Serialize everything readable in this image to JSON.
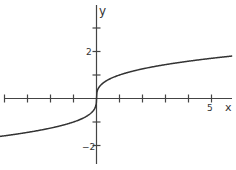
{
  "chart_data": {
    "type": "line",
    "title": "",
    "function": "y = cbrt(x)",
    "xlabel": "x",
    "ylabel": "y",
    "xlim": [
      -4.2,
      5.9
    ],
    "ylim": [
      -2.8,
      4
    ],
    "x_tick_labels": [
      {
        "value": 5,
        "label": "5"
      }
    ],
    "y_tick_labels": [
      {
        "value": 2,
        "label": "2"
      },
      {
        "value": -2,
        "label": "−2"
      }
    ],
    "x_ticks": [
      -4,
      -3,
      -2,
      -1,
      1,
      2,
      3,
      4,
      5
    ],
    "y_ticks": [
      3,
      2,
      1,
      -1,
      -2
    ],
    "grid": false,
    "series": [
      {
        "name": "cube root",
        "x": [
          -4.2,
          -3,
          -2,
          -1,
          -0.5,
          -0.1,
          0,
          0.1,
          0.5,
          1,
          2,
          3,
          4,
          5,
          5.9
        ],
        "values": [
          -1.61,
          -1.44,
          -1.26,
          -1.0,
          -0.79,
          -0.46,
          0,
          0.46,
          0.79,
          1.0,
          1.26,
          1.44,
          1.59,
          1.71,
          1.81
        ]
      }
    ],
    "colors": {
      "axis": "#444444",
      "curve": "#333333"
    }
  },
  "labels": {
    "x_axis": "x",
    "y_axis": "y",
    "x5": "5",
    "y2": "2",
    "yneg2": "−2"
  }
}
